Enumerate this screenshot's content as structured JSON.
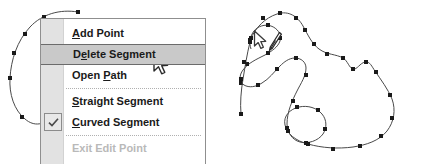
{
  "app": {
    "title": "Path editing context menu"
  },
  "context_menu": {
    "name": "path-edit-context-menu",
    "items": [
      {
        "label": "Add Point",
        "accel": "A",
        "state": "normal",
        "checked": false,
        "separator_after": false
      },
      {
        "label": "Delete Segment",
        "accel": "e",
        "state": "selected",
        "checked": false,
        "separator_after": false
      },
      {
        "label": "Open Path",
        "accel": "P",
        "state": "normal",
        "checked": false,
        "separator_after": true
      },
      {
        "label": "Straight Segment",
        "accel": "S",
        "state": "normal",
        "checked": false,
        "separator_after": false
      },
      {
        "label": "Curved Segment",
        "accel": "C",
        "state": "normal",
        "checked": true,
        "separator_after": true
      },
      {
        "label": "Exit Edit Point",
        "accel": "",
        "state": "disabled",
        "checked": false,
        "separator_after": false
      }
    ],
    "colors": {
      "background": "#ffffff",
      "border": "#8f8f8f",
      "gutter": "#e2e2e2",
      "highlight_fill": "#c9c9c9",
      "highlight_border": "#6b6b6b",
      "text": "#1a1a1a",
      "disabled_text": "#b9b9b9",
      "separator": "#b0b0b0"
    }
  },
  "icons": {
    "checkmark": "check-icon",
    "menu_pointer": "arrow-cursor-icon",
    "pen_pointer": "pen-cursor-icon"
  },
  "artwork": {
    "left_path": {
      "name": "left-curve-path",
      "stroke": "#4a4a4a",
      "anchor_fill": "#1a1a1a",
      "anchor_size": 4,
      "d": "M 78 12 C 60 9 42 14 30 27 C 17 41 11 60 10 78 C 9 94 14 110 25 119 C 34 127 45 125 51 116 C 58 105 63 92 70 82 C 78 70 90 61 104 56",
      "anchors": [
        [
          78,
          12
        ],
        [
          44,
          17
        ],
        [
          25,
          34
        ],
        [
          14,
          53
        ],
        [
          10,
          78
        ],
        [
          22,
          117
        ],
        [
          44,
          121
        ],
        [
          62,
          97
        ],
        [
          79,
          75
        ],
        [
          104,
          56
        ]
      ]
    },
    "right_path": {
      "name": "right-vector-shape",
      "stroke": "#4a4a4a",
      "anchor_fill": "#1a1a1a",
      "anchor_size": 4,
      "d": "M 250 40 C 256 27 265 18 277 14 C 289 10 298 17 303 26 C 308 35 312 44 319 49 C 327 55 336 54 343 58 C 348 61 349 68 353 69 C 357 70 360 63 365 62 C 370 61 372 67 375 71 C 381 80 388 89 392 99 C 396 110 394 122 387 131 C 379 141 366 145 353 147 C 338 149 322 148 308 144 C 296 141 287 134 285 125 C 283 116 290 109 299 107 C 308 105 317 108 322 114 C 327 120 327 128 323 134 C 318 141 308 144 300 142 C 292 140 287 132 287 124 C 287 112 292 101 297 91 C 301 83 306 76 306 68 C 306 62 301 58 295 58 C 289 58 284 62 280 66 C 274 72 269 79 262 83 C 256 87 249 88 244 85 C 239 82 239 75 243 70 C 248 63 257 59 265 55 C 272 51 278 47 280 41 C 282 34 277 28 271 26 C 265 24 258 26 254 31 C 250 36 249 43 251 49",
      "anchors": [
        [
          250,
          40
        ],
        [
          263,
          18
        ],
        [
          280,
          13
        ],
        [
          296,
          18
        ],
        [
          305,
          30
        ],
        [
          314,
          44
        ],
        [
          327,
          54
        ],
        [
          343,
          58
        ],
        [
          353,
          69
        ],
        [
          366,
          62
        ],
        [
          376,
          72
        ],
        [
          390,
          95
        ],
        [
          392,
          118
        ],
        [
          381,
          136
        ],
        [
          360,
          146
        ],
        [
          333,
          149
        ],
        [
          308,
          144
        ],
        [
          288,
          131
        ],
        [
          297,
          107
        ],
        [
          318,
          110
        ],
        [
          325,
          129
        ],
        [
          306,
          143
        ],
        [
          287,
          128
        ],
        [
          293,
          101
        ],
        [
          306,
          75
        ],
        [
          296,
          58
        ],
        [
          277,
          69
        ],
        [
          258,
          85
        ],
        [
          241,
          83
        ],
        [
          247,
          64
        ],
        [
          268,
          53
        ],
        [
          280,
          38
        ],
        [
          268,
          25
        ],
        [
          251,
          38
        ]
      ]
    },
    "left_stray": {
      "name": "left-open-stub",
      "stroke": "#4a4a4a",
      "d": "M 250 42 C 247 54 245 67 243 79 C 241 91 240 103 241 114",
      "anchors": [
        [
          250,
          42
        ],
        [
          244,
          62
        ],
        [
          241,
          79
        ],
        [
          241,
          114
        ]
      ]
    }
  }
}
